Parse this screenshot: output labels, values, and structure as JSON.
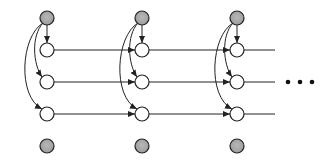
{
  "diagram": {
    "type": "graphical-model",
    "colors": {
      "shaded_fill": "#a8a8a8",
      "white_fill": "#ffffff",
      "stroke": "#222222"
    },
    "node_radius": 7,
    "columns": [
      {
        "x": 47,
        "top_shaded": {
          "y": 18
        },
        "hidden": [
          {
            "y": 50
          },
          {
            "y": 82
          },
          {
            "y": 114
          }
        ],
        "bottom_shaded": {
          "y": 146
        }
      },
      {
        "x": 142,
        "top_shaded": {
          "y": 18
        },
        "hidden": [
          {
            "y": 50
          },
          {
            "y": 82
          },
          {
            "y": 114
          }
        ],
        "bottom_shaded": {
          "y": 146
        }
      },
      {
        "x": 237,
        "top_shaded": {
          "y": 18
        },
        "hidden": [
          {
            "y": 50
          },
          {
            "y": 82
          },
          {
            "y": 114
          }
        ],
        "bottom_shaded": {
          "y": 146
        }
      }
    ],
    "horizontal_edges_rows": [
      50,
      82,
      114
    ],
    "ellipsis": {
      "text": "• • •",
      "x": 300,
      "y": 82
    }
  }
}
